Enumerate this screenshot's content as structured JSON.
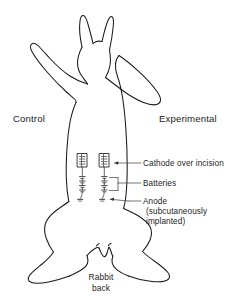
{
  "figure": {
    "type": "anatomical-line-diagram",
    "background_color": "#ffffff",
    "line_color": "#1a1a1a",
    "text_color": "#1c1c1c"
  },
  "side_labels": {
    "left": "Control",
    "right": "Experimental"
  },
  "caption": {
    "rabbit_back": "Rabbit\nback"
  },
  "callouts": [
    {
      "id": "cathode",
      "label": "Cathode over incision",
      "target": "cathode-electrode"
    },
    {
      "id": "batteries",
      "label": "Batteries",
      "target": "battery-chain"
    },
    {
      "id": "anode",
      "label": "Anode",
      "sublabel": "(subcutaneously\nimplanted)",
      "target": "anode-electrode"
    }
  ],
  "devices": [
    {
      "id": "control-device",
      "side": "Control",
      "components": [
        "cathode-electrode",
        "battery-chain",
        "anode-electrode"
      ]
    },
    {
      "id": "experimental-device",
      "side": "Experimental",
      "components": [
        "cathode-electrode",
        "battery-chain",
        "anode-electrode"
      ]
    }
  ]
}
